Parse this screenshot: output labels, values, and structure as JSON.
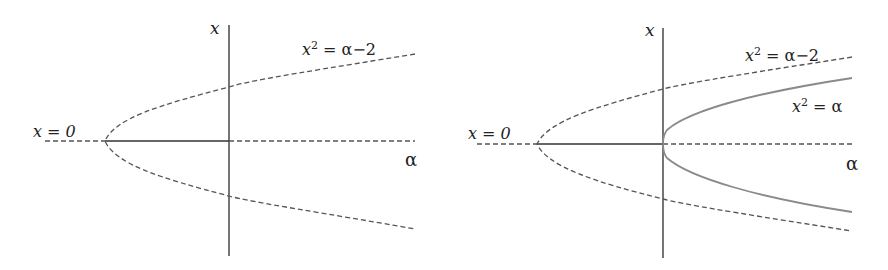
{
  "figure": {
    "panels": [
      {
        "id": "left",
        "axis_labels": {
          "vertical": "x",
          "horizontal": "α"
        },
        "curve_labels": [
          {
            "id": "parabola-shifted",
            "var": "x",
            "exp": "2",
            "rhs": " = α−2"
          },
          {
            "id": "trivial-branch",
            "text": "x = 0"
          }
        ],
        "description": "Pitchfork of x² = α−2 (dashed, unstable) with x = 0 branch; solid between the turning point and α = 0"
      },
      {
        "id": "right",
        "axis_labels": {
          "vertical": "x",
          "horizontal": "α"
        },
        "curve_labels": [
          {
            "id": "parabola-shifted",
            "var": "x",
            "exp": "2",
            "rhs": " = α−2"
          },
          {
            "id": "parabola",
            "var": "x",
            "exp": "2",
            "rhs": " = α"
          },
          {
            "id": "trivial-branch",
            "text": "x = 0"
          }
        ],
        "description": "Same as left plus stable branch x² = α (solid gray) emanating from origin"
      }
    ],
    "colors": {
      "axis": "#3a3a3a",
      "dashed": "#555555",
      "solid_branch": "#333333",
      "stable_parabola": "#8a8a8a"
    }
  }
}
